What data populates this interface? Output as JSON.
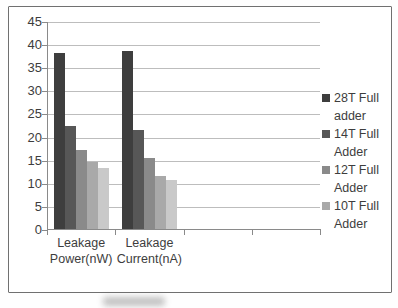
{
  "window": {
    "background": "#ffffff"
  },
  "chart_data": {
    "type": "bar",
    "title": "",
    "xlabel": "",
    "ylabel": "",
    "categories": [
      "Leakage Power(nW)",
      "Leakage Current(nA)"
    ],
    "series": [
      {
        "name": "28T Full adder",
        "color": "#3e3e3e",
        "in_legend": true,
        "values": [
          38.0,
          38.5
        ]
      },
      {
        "name": "14T Full Adder",
        "color": "#575757",
        "in_legend": true,
        "values": [
          22.3,
          21.4
        ]
      },
      {
        "name": "12T Full Adder",
        "color": "#8a8a8a",
        "in_legend": true,
        "values": [
          17.0,
          15.3
        ]
      },
      {
        "name": "10T Full Adder",
        "color": "#a9a9a9",
        "in_legend": true,
        "values": [
          14.6,
          11.4
        ]
      },
      {
        "name": "",
        "color": "#c9c9c9",
        "in_legend": false,
        "values": [
          13.2,
          10.6
        ]
      }
    ],
    "ylim": [
      0,
      45
    ],
    "yticks": [
      0,
      5,
      10,
      15,
      20,
      25,
      30,
      35,
      40,
      45
    ],
    "x_axis_slots": 4,
    "grid": true,
    "legend": {
      "position": "right",
      "entries": [
        "28T Full adder",
        "14T Full Adder",
        "12T Full Adder",
        "10T Full Adder"
      ]
    },
    "colors": {
      "gridline": "#bdbdbd",
      "axis": "#8a8a8a",
      "text": "#3d3d3d",
      "frame_border": "#707070",
      "plot_background": "#ffffff"
    }
  }
}
